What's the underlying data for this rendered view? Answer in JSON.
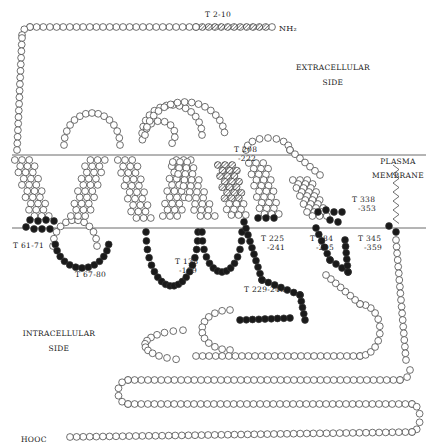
{
  "regions": {
    "extracellular": {
      "line1": "EXTRACELLULAR",
      "line2": "SIDE"
    },
    "membrane": {
      "line1": "PLASMA",
      "line2": "MEMBRANE"
    },
    "intracellular": {
      "line1": "INTRACELLULAR",
      "line2": "SIDE"
    }
  },
  "termini": {
    "n": "NH₂",
    "c": "HOOC"
  },
  "peptides": [
    {
      "id": "t2_10",
      "line1": "T 2-10",
      "line2": ""
    },
    {
      "id": "t61_71",
      "line1": "T 61-71",
      "line2": ""
    },
    {
      "id": "t67_80",
      "line1": "T 67-80",
      "line2": ""
    },
    {
      "id": "t138_159",
      "line1": "T 138",
      "line2": "-159"
    },
    {
      "id": "t208_222",
      "line1": "T 208",
      "line2": "-222"
    },
    {
      "id": "t225_241",
      "line1": "T 225",
      "line2": "-241"
    },
    {
      "id": "t229_248",
      "line1": "T 229-248",
      "line2": ""
    },
    {
      "id": "t284_295",
      "line1": "T 284",
      "line2": "-295"
    },
    {
      "id": "t338_353",
      "line1": "T 338",
      "line2": "-353"
    },
    {
      "id": "t345_359",
      "line1": "T 345",
      "line2": "-359"
    }
  ],
  "colors": {
    "line": "#333333",
    "open": "#ffffff",
    "filled": "#1a1a1a",
    "hatched": "#777777"
  }
}
